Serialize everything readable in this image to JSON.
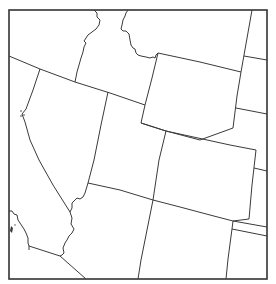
{
  "map": {
    "title": "",
    "region": "Western United States",
    "style": "state outline map, no labels",
    "colors": {
      "background": "#ffffff",
      "border": "#3a3a3a",
      "frame": "#333333"
    },
    "labels": []
  }
}
